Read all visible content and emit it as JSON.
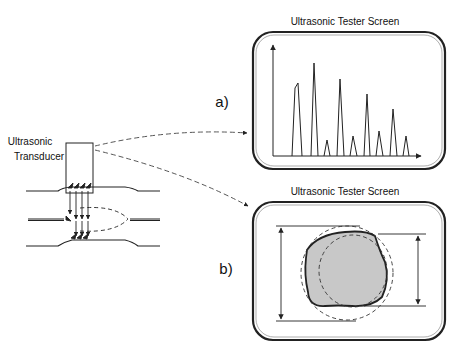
{
  "figure": {
    "transducer_label_line1": "Ultrasonic",
    "transducer_label_line2": "Transducer",
    "panel_a": {
      "label": "a)",
      "title": "Ultrasonic Tester Screen",
      "description": "A-scan echo peaks along time axis",
      "peaks": [
        {
          "x_left": 292,
          "x_right": 302,
          "top": 83
        },
        {
          "x_left": 311,
          "x_right": 318,
          "top": 63
        },
        {
          "x_left": 324,
          "x_right": 330,
          "top": 140
        },
        {
          "x_left": 337,
          "x_right": 344,
          "top": 79
        },
        {
          "x_left": 350,
          "x_right": 357,
          "top": 136
        },
        {
          "x_left": 364,
          "x_right": 370,
          "top": 94
        },
        {
          "x_left": 376,
          "x_right": 383,
          "top": 131
        },
        {
          "x_left": 390,
          "x_right": 397,
          "top": 109
        },
        {
          "x_left": 403,
          "x_right": 409,
          "top": 136
        }
      ]
    },
    "panel_b": {
      "label": "b)",
      "title": "Ultrasonic Tester Screen",
      "description": "Cross-section of inner wall with max/min diameter markers"
    },
    "caption": ""
  }
}
